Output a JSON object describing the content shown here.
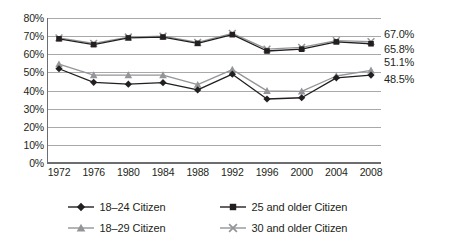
{
  "chart_data": {
    "type": "line",
    "title": "",
    "xlabel": "",
    "ylabel": "",
    "ylim": [
      0,
      80
    ],
    "ytick_labels": [
      "80%",
      "70%",
      "60%",
      "50%",
      "40%",
      "30%",
      "20%",
      "10%",
      "0%"
    ],
    "ytick_values": [
      80,
      70,
      60,
      50,
      40,
      30,
      20,
      10,
      0
    ],
    "grid": true,
    "legend_position": "bottom",
    "categories": [
      "1972",
      "1976",
      "1980",
      "1984",
      "1988",
      "1992",
      "1996",
      "2000",
      "2004",
      "2008"
    ],
    "x": [
      1972,
      1976,
      1980,
      1984,
      1988,
      1992,
      1996,
      2000,
      2004,
      2008
    ],
    "series": [
      {
        "name": "18–24 Citizen",
        "marker": "diamond",
        "color": "#231f20",
        "values": [
          52.0,
          44.5,
          43.5,
          44.3,
          40.3,
          49.0,
          35.3,
          36.0,
          47.0,
          48.5
        ],
        "end_label": "48.5%"
      },
      {
        "name": "25 and older Citizen",
        "marker": "square",
        "color": "#231f20",
        "values": [
          68.5,
          65.3,
          69.0,
          69.5,
          66.0,
          70.8,
          61.8,
          62.8,
          66.8,
          65.8
        ],
        "end_label": "65.8%"
      },
      {
        "name": "18–29 Citizen",
        "marker": "triangle",
        "color": "#939598",
        "values": [
          54.5,
          48.5,
          48.5,
          48.5,
          43.2,
          51.5,
          39.8,
          39.5,
          48.0,
          51.1
        ],
        "end_label": "51.1%"
      },
      {
        "name": "30 and older Citizen",
        "marker": "x",
        "color": "#939598",
        "values": [
          69.0,
          66.0,
          69.5,
          70.0,
          66.5,
          71.5,
          62.8,
          63.8,
          67.5,
          67.0
        ],
        "end_label": "67.0%"
      }
    ],
    "annotations": [
      {
        "text": "67.0%",
        "series": "30 and older Citizen",
        "value": 67.0
      },
      {
        "text": "65.8%",
        "series": "25 and older Citizen",
        "value": 65.8
      },
      {
        "text": "51.1%",
        "series": "18–29 Citizen",
        "value": 51.1
      },
      {
        "text": "48.5%",
        "series": "18–24 Citizen",
        "value": 48.5
      }
    ]
  },
  "legend": {
    "items": [
      {
        "label": "18–24 Citizen",
        "marker": "diamond",
        "color": "#231f20"
      },
      {
        "label": "25 and older Citizen",
        "marker": "square",
        "color": "#231f20"
      },
      {
        "label": "18–29 Citizen",
        "marker": "triangle",
        "color": "#939598"
      },
      {
        "label": "30 and older Citizen",
        "marker": "x",
        "color": "#939598"
      }
    ]
  },
  "colors": {
    "dark_series": "#231f20",
    "light_series": "#939598",
    "gridline": "#a7a9ac",
    "axis": "#6d6e71",
    "background": "#ffffff"
  }
}
